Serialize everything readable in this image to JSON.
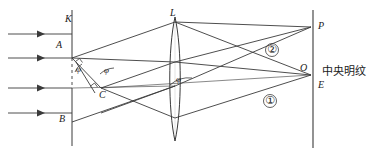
{
  "figure": {
    "type": "optics-ray-diagram",
    "title_visible": false,
    "background_color": "#ffffff",
    "line_color": "#3a3a3a",
    "text_color": "#1a1a1a",
    "width": 373,
    "height": 158
  },
  "labels": {
    "plate_K": "K",
    "point_A": "A",
    "point_B": "B",
    "point_C": "C",
    "lens_L": "L",
    "point_P": "P",
    "point_O": "O",
    "screen_E": "E",
    "central_fringe": "中央明纹",
    "ray_one": "①",
    "ray_two": "②",
    "angle_1": "φ",
    "angle_2": "φ",
    "angle_3": "φ"
  },
  "geometry": {
    "incoming_rays": [
      {
        "name": "incoming-ray-1",
        "y": 34,
        "x_start": 8,
        "x_end": 72,
        "arrow_x": 42
      },
      {
        "name": "incoming-ray-2",
        "y": 58,
        "x_start": 8,
        "x_end": 72,
        "arrow_x": 42
      },
      {
        "name": "incoming-ray-3",
        "y": 88,
        "x_start": 8,
        "x_end": 72,
        "arrow_x": 42
      },
      {
        "name": "incoming-ray-4",
        "y": 113,
        "x_start": 8,
        "x_end": 72,
        "arrow_x": 42
      }
    ],
    "slit_plate": {
      "x": 72,
      "y_top": 10,
      "y_bottom": 146
    },
    "lens": {
      "cx": 175,
      "cy": 79,
      "half_height": 62,
      "half_width": 6
    },
    "screen": {
      "x": 313,
      "y_top": 10,
      "y_bottom": 148
    },
    "point_A": {
      "x": 72,
      "y": 58
    },
    "point_C": {
      "x": 100,
      "y": 88
    },
    "point_P": {
      "x": 311,
      "y": 27
    },
    "point_O": {
      "x": 311,
      "y": 75
    },
    "optical_axis_y": 88
  },
  "colors": {
    "stroke": "#3a3a3a",
    "text": "#1a1a1a",
    "background": "#ffffff"
  }
}
